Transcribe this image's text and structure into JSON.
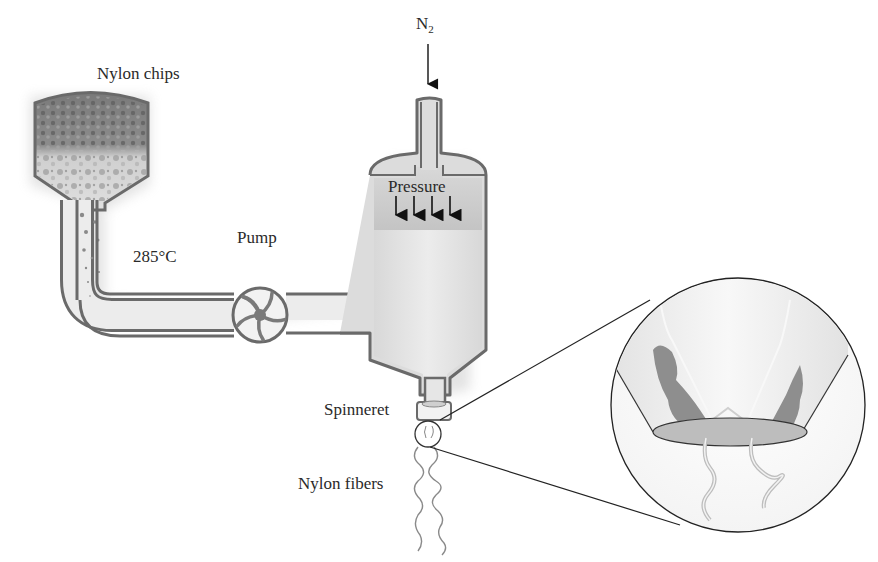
{
  "diagram": {
    "type": "process-schematic",
    "labels": {
      "nylon_chips": "Nylon chips",
      "temperature": "285°C",
      "pump": "Pump",
      "nitrogen": "N",
      "nitrogen_subscript": "2",
      "pressure": "Pressure",
      "spinneret": "Spinneret",
      "nylon_fibers": "Nylon fibers"
    },
    "components": [
      {
        "id": "hopper",
        "name": "Nylon chips hopper"
      },
      {
        "id": "melt-pipe",
        "name": "Heated pipe at 285°C"
      },
      {
        "id": "pump",
        "name": "Pump (impeller)"
      },
      {
        "id": "pressure-vessel",
        "name": "Pressurized vessel with N2 inlet"
      },
      {
        "id": "spinneret",
        "name": "Spinneret"
      },
      {
        "id": "magnified-view",
        "name": "Magnified spinneret cross-section"
      },
      {
        "id": "fibers",
        "name": "Nylon fibers"
      }
    ],
    "flow": [
      "hopper",
      "melt-pipe",
      "pump",
      "pressure-vessel",
      "spinneret",
      "fibers"
    ],
    "colors": {
      "outline": "#6a6a6a",
      "fill_light": "#e4e4e4",
      "fill_mid": "#c8c8c8",
      "fill_dark": "#8a8a8a",
      "line": "#333333"
    }
  }
}
